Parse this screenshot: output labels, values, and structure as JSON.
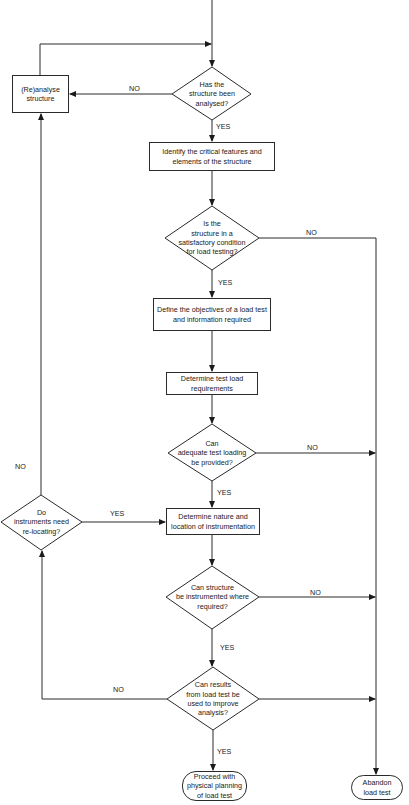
{
  "diagram": {
    "type": "flowchart",
    "nodes": {
      "reanalyse": {
        "shape": "process",
        "text": "(Re)analyse\nstructure"
      },
      "q_analysed": {
        "shape": "decision",
        "text": "Has the\nstructure been\nanalysed?"
      },
      "identify": {
        "shape": "process",
        "text": "Identify the critical features and\nelements of the structure"
      },
      "q_condition": {
        "shape": "decision",
        "text": "Is the\nstructure in a\nsatisfactory condition\nfor load testing?"
      },
      "define": {
        "shape": "process",
        "text": "Define the objectives of a load test\nand information required"
      },
      "determine_load": {
        "shape": "process",
        "text": "Determine test load\nrequirements"
      },
      "q_loading": {
        "shape": "decision",
        "text": "Can\nadequate test loading\nbe provided?"
      },
      "q_relocate": {
        "shape": "decision",
        "text": "Do\ninstruments need\nre-locating?"
      },
      "determine_instr": {
        "shape": "process",
        "text": "Determine nature and\nlocation of instrumentation"
      },
      "q_instrumented": {
        "shape": "decision",
        "text": "Can structure\nbe instrumented where\nrequired?"
      },
      "q_results": {
        "shape": "decision",
        "text": "Can results\nfrom load test be\nused to improve\nanalysis?"
      },
      "proceed": {
        "shape": "terminal",
        "text": "Proceed with\nphysical planning\nof load test"
      },
      "abandon": {
        "shape": "terminal",
        "text": "Abandon\nload test"
      }
    },
    "edge_labels": {
      "analysed_no": "NO",
      "analysed_yes": "YES",
      "condition_no": "NO",
      "condition_yes": "YES",
      "loading_no": "NO",
      "loading_yes": "YES",
      "relocate_yes": "YES",
      "relocate_no": "NO",
      "instrumented_no": "NO",
      "instrumented_yes": "YES",
      "results_no": "NO",
      "results_yes": "YES"
    },
    "edges": [
      {
        "from": "start",
        "to": "q_analysed"
      },
      {
        "from": "q_analysed",
        "to": "reanalyse",
        "label": "NO"
      },
      {
        "from": "reanalyse",
        "to": "q_analysed"
      },
      {
        "from": "q_analysed",
        "to": "identify",
        "label": "YES"
      },
      {
        "from": "identify",
        "to": "q_condition"
      },
      {
        "from": "q_condition",
        "to": "abandon",
        "label": "NO"
      },
      {
        "from": "q_condition",
        "to": "define",
        "label": "YES"
      },
      {
        "from": "define",
        "to": "determine_load"
      },
      {
        "from": "determine_load",
        "to": "q_loading"
      },
      {
        "from": "q_loading",
        "to": "abandon",
        "label": "NO"
      },
      {
        "from": "q_loading",
        "to": "determine_instr",
        "label": "YES"
      },
      {
        "from": "q_relocate",
        "to": "determine_instr",
        "label": "YES"
      },
      {
        "from": "q_relocate",
        "to": "reanalyse",
        "label": "NO"
      },
      {
        "from": "determine_instr",
        "to": "q_instrumented"
      },
      {
        "from": "q_instrumented",
        "to": "abandon",
        "label": "NO"
      },
      {
        "from": "q_instrumented",
        "to": "q_results",
        "label": "YES"
      },
      {
        "from": "q_results",
        "to": "q_relocate",
        "label": "NO"
      },
      {
        "from": "q_results",
        "to": "abandon"
      },
      {
        "from": "q_results",
        "to": "proceed",
        "label": "YES"
      }
    ]
  }
}
